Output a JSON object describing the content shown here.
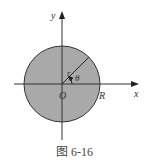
{
  "figure": {
    "caption": "图 6-16",
    "labels": {
      "y_axis": "y",
      "x_axis": "x",
      "origin": "O",
      "radius_label": "R",
      "r_label": "r",
      "theta_label": "θ"
    },
    "colors": {
      "disk_fill": "#a9a9a9",
      "stroke": "#333333",
      "background": "#ffffff"
    },
    "geometry": {
      "center": [
        62,
        84
      ],
      "radius": 38
    }
  }
}
